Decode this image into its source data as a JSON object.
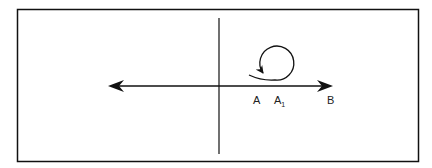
{
  "diagram": {
    "labels": {
      "a": "A",
      "a1_main": "A",
      "a1_sub": "1",
      "b": "B"
    },
    "colors": {
      "stroke": "#111111",
      "background": "#ffffff"
    }
  }
}
